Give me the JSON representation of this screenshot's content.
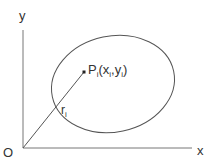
{
  "diagram": {
    "axis_x_label": "x",
    "axis_y_label": "y",
    "origin_label": "O",
    "point_label_main": "P",
    "point_label_sub": "i",
    "point_coords_open": "(x",
    "point_coords_sub1": "i",
    "point_coords_mid": ",y",
    "point_coords_sub2": "i",
    "point_coords_close": ")",
    "radius_label_main": "r",
    "radius_label_sub": "i",
    "colors": {
      "stroke": "#555555",
      "text": "#333333",
      "background": "#ffffff"
    }
  }
}
